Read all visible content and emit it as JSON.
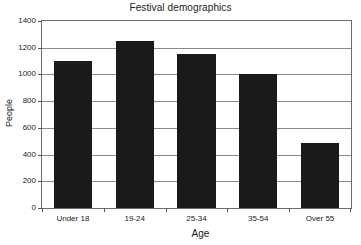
{
  "chart_data": {
    "type": "bar",
    "title": "Festival demographics",
    "xlabel": "Age",
    "ylabel": "People",
    "categories": [
      "Under 18",
      "19-24",
      "25-34",
      "35-54",
      "Over 55"
    ],
    "values": [
      1100,
      1250,
      1150,
      1000,
      490
    ],
    "ylim": [
      0,
      1400
    ],
    "yticks": [
      0,
      200,
      400,
      600,
      800,
      1000,
      1200,
      1400
    ],
    "ytick_labels": [
      "0",
      "200",
      "400",
      "600",
      "800",
      "1000",
      "1200",
      "1400"
    ],
    "grid": true,
    "legend": false,
    "bar_color": "#1a1a1a",
    "axis_color": "#6d6d6d",
    "grid_color": "#8a8a8a",
    "background_color": "#ffffff"
  }
}
